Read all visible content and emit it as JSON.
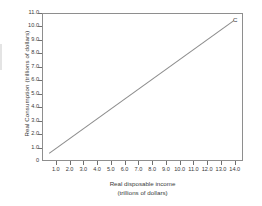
{
  "chart_data": {
    "type": "line",
    "title": "",
    "xlabel": "Real disposable income",
    "xlabel_units": "(trillions of dollars)",
    "ylabel": "Real Consumption (trillions of dollars)",
    "xlim": [
      0,
      14.6
    ],
    "ylim": [
      0,
      11.0
    ],
    "grid": false,
    "legend": "none",
    "x_ticks": [
      "1.0",
      "2.0",
      "3.0",
      "4.0",
      "5.0",
      "6.0",
      "7.0",
      "8.0",
      "9.0",
      "10.0",
      "11.0",
      "12.0",
      "13.0",
      "14.0"
    ],
    "x_tick_values": [
      1,
      2,
      3,
      4,
      5,
      6,
      7,
      8,
      9,
      10,
      11,
      12,
      13,
      14
    ],
    "y_ticks": [
      "0",
      "1.0",
      "2.0",
      "3.0",
      "4.0",
      "5.0",
      "6.0",
      "7.0",
      "8.0",
      "9.0",
      "10.0",
      "11.0"
    ],
    "y_tick_values": [
      0,
      1,
      2,
      3,
      4,
      5,
      6,
      7,
      8,
      9,
      10,
      11
    ],
    "series": [
      {
        "name": "C",
        "annotation": "C",
        "color": "#8c8c8c",
        "x": [
          0.45,
          14.0
        ],
        "y": [
          0.5,
          10.5
        ]
      }
    ]
  },
  "figure": {
    "line_color": "#8c8c8c",
    "axis_color": "#8e8e8e",
    "text_color": "#3a3a3a",
    "background": "#ffffff"
  }
}
